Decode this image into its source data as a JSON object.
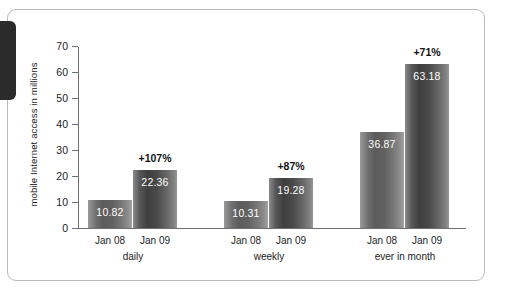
{
  "chart_data": {
    "type": "bar",
    "title": "",
    "xlabel": "",
    "ylabel": "mobile Internet access in millions",
    "ylim": [
      0,
      70
    ],
    "yticks": [
      70,
      60,
      50,
      40,
      30,
      20,
      10,
      0
    ],
    "grid": false,
    "legend": "none",
    "categories": [
      "daily",
      "weekly",
      "ever in month"
    ],
    "series": [
      {
        "name": "Jan 08",
        "values": [
          10.82,
          10.31,
          36.87
        ]
      },
      {
        "name": "Jan 09",
        "values": [
          22.36,
          19.28,
          63.18
        ]
      }
    ],
    "groups": [
      {
        "label": "daily",
        "growth": "+107%",
        "bars": [
          {
            "tick": "Jan 08",
            "value": 10.82,
            "value_label": "10.82",
            "shade": "light"
          },
          {
            "tick": "Jan 09",
            "value": 22.36,
            "value_label": "22.36",
            "shade": "dark"
          }
        ]
      },
      {
        "label": "weekly",
        "growth": "+87%",
        "bars": [
          {
            "tick": "Jan 08",
            "value": 10.31,
            "value_label": "10.31",
            "shade": "light"
          },
          {
            "tick": "Jan 09",
            "value": 19.28,
            "value_label": "19.28",
            "shade": "dark"
          }
        ]
      },
      {
        "label": "ever in month",
        "growth": "+71%",
        "bars": [
          {
            "tick": "Jan 08",
            "value": 36.87,
            "value_label": "36.87",
            "shade": "light"
          },
          {
            "tick": "Jan 09",
            "value": 63.18,
            "value_label": "63.18",
            "shade": "dark"
          }
        ]
      }
    ],
    "annotations": [
      "+107%",
      "+87%",
      "+71%"
    ],
    "colors": {
      "bar_light": "#6f6f6f",
      "bar_dark": "#4a4a4a",
      "axis": "#6e7073",
      "text": "#1c1c1c",
      "frame_border": "#b9bbbd",
      "value_text": "#ffffff",
      "tab": "#2b2b2b"
    }
  }
}
